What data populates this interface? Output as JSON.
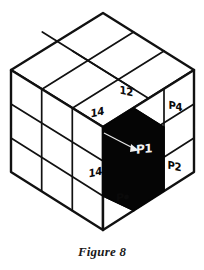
{
  "figure": {
    "caption": "Figure 8",
    "ink_color": "#111111",
    "notch_color": "#050505",
    "background_color": "#ffffff"
  },
  "labels": {
    "top_face_label": "12",
    "left_upper_label": "14",
    "left_lower_label": "14",
    "right_upper_label": "P4",
    "right_lower_label": "P2",
    "bottom_label": "P",
    "bottom_label_has_dot": true,
    "notch_label": "P1"
  },
  "annotations": {
    "leader_arrow": "arrow pointing from upper-left of notch to P1"
  }
}
